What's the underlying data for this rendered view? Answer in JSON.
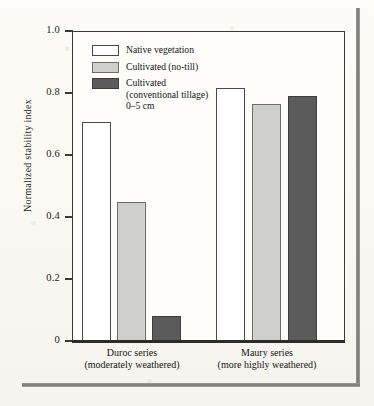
{
  "figure": {
    "background_color": "#fbfaf6",
    "frame_color": "#3a3a3a"
  },
  "chart_data": {
    "type": "bar",
    "title": "",
    "xlabel": "",
    "ylabel": "Normalized stability index",
    "ylim": [
      0,
      1.0
    ],
    "yticks": [
      "0",
      "0.2",
      "0.4",
      "0.6",
      "0.8",
      "1.0"
    ],
    "ytick_values": [
      0,
      0.2,
      0.4,
      0.6,
      0.8,
      1.0
    ],
    "grid": false,
    "legend_position": "top-left inside axes",
    "categories": [
      "Duroc series (moderately weathered)",
      "Maury series (more highly weathered)"
    ],
    "category_lines": [
      [
        "Duroc series",
        "(moderately weathered)"
      ],
      [
        "Maury series",
        "(more highly weathered)"
      ]
    ],
    "series": [
      {
        "name": "Native vegetation",
        "color": "#ffffff",
        "values": [
          0.705,
          0.815
        ]
      },
      {
        "name": "Cultivated (no-till)",
        "color": "#cfcfcc",
        "values": [
          0.448,
          0.765
        ]
      },
      {
        "name": "Cultivated (conventional tillage) 0–5 cm",
        "color": "#5b5b5b",
        "values": [
          0.08,
          0.79
        ]
      }
    ]
  },
  "legend": {
    "items": [
      {
        "label": "Native vegetation",
        "swatch": "white"
      },
      {
        "label": "Cultivated (no-till)",
        "swatch": "light"
      },
      {
        "label_line1": "Cultivated",
        "label_line2": "(conventional tillage)",
        "label_line3": "0–5 cm",
        "swatch": "dark"
      }
    ]
  },
  "axis": {
    "y_title": "Normalized stability index",
    "y_labels": [
      "1.0",
      "0.8",
      "0.6",
      "0.4",
      "0.2",
      "0"
    ]
  }
}
